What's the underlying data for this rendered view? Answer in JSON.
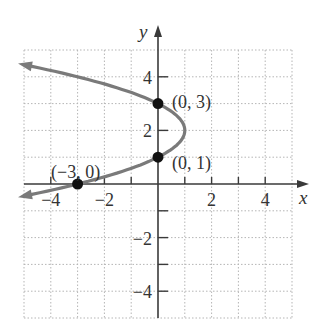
{
  "chart_data": {
    "type": "line",
    "title": "",
    "xlabel": "x",
    "ylabel": "y",
    "xlim": [
      -5,
      5
    ],
    "ylim": [
      -5,
      5
    ],
    "grid": true,
    "x_ticks": [
      -4,
      -2,
      2,
      4
    ],
    "y_ticks": [
      -4,
      -2,
      2,
      4
    ],
    "x_tick_labels": [
      "−4",
      "−2",
      "2",
      "4"
    ],
    "y_tick_labels": [
      "−4",
      "−2",
      "2",
      "4"
    ],
    "curve": {
      "equation": "x = -(y-1)(y-3)",
      "vertex": [
        1,
        2
      ],
      "y_range": [
        -0.45,
        4.45
      ],
      "color": "#7a7a7a",
      "arrows": "both"
    },
    "points": [
      {
        "x": 0,
        "y": 3,
        "label": "(0, 3)"
      },
      {
        "x": 0,
        "y": 1,
        "label": "(0, 1)"
      },
      {
        "x": -3,
        "y": 0,
        "label": "(−3, 0)"
      }
    ]
  },
  "axes": {
    "x_label": "x",
    "y_label": "y"
  }
}
